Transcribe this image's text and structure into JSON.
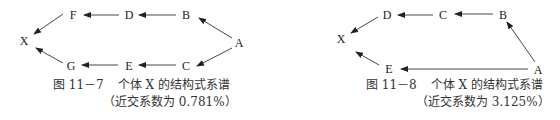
{
  "figures": [
    {
      "id": "fig-11-7",
      "nodes": [
        {
          "label": "X",
          "x": 24,
          "y": 41
        },
        {
          "label": "F",
          "x": 73,
          "y": 15
        },
        {
          "label": "D",
          "x": 129,
          "y": 15
        },
        {
          "label": "B",
          "x": 186,
          "y": 15
        },
        {
          "label": "G",
          "x": 71,
          "y": 66
        },
        {
          "label": "E",
          "x": 129,
          "y": 66
        },
        {
          "label": "C",
          "x": 186,
          "y": 66
        },
        {
          "label": "A",
          "x": 239,
          "y": 43
        }
      ],
      "edges": [
        {
          "from": "A",
          "to": "B"
        },
        {
          "from": "B",
          "to": "D"
        },
        {
          "from": "D",
          "to": "F"
        },
        {
          "from": "F",
          "to": "X"
        },
        {
          "from": "A",
          "to": "C"
        },
        {
          "from": "C",
          "to": "E"
        },
        {
          "from": "E",
          "to": "G"
        },
        {
          "from": "G",
          "to": "X"
        }
      ],
      "caption": {
        "number": "图 11－7",
        "title": "个体 X 的结构式系谱",
        "note": "（近交系数为 0.781%）"
      }
    },
    {
      "id": "fig-11-8",
      "nodes": [
        {
          "label": "X",
          "x": 341,
          "y": 39
        },
        {
          "label": "D",
          "x": 387,
          "y": 15
        },
        {
          "label": "C",
          "x": 443,
          "y": 15
        },
        {
          "label": "B",
          "x": 503,
          "y": 15
        },
        {
          "label": "E",
          "x": 389,
          "y": 69
        },
        {
          "label": "A",
          "x": 538,
          "y": 70
        }
      ],
      "edges": [
        {
          "from": "A",
          "to": "B"
        },
        {
          "from": "B",
          "to": "C"
        },
        {
          "from": "C",
          "to": "D"
        },
        {
          "from": "D",
          "to": "X"
        },
        {
          "from": "A",
          "to": "E"
        },
        {
          "from": "E",
          "to": "X"
        }
      ],
      "caption": {
        "number": "图 11－8",
        "title": "个体 X 的结构式系谱",
        "note": "（近交系数为 3.125%）"
      }
    }
  ]
}
